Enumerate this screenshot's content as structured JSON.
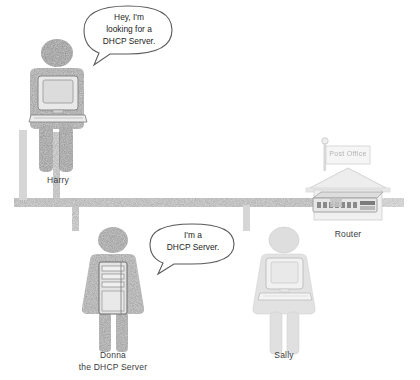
{
  "diagram": {
    "background_color": "#ffffff"
  },
  "network": {
    "bus_label": "network-bus",
    "bus_color": "#c9c9c9",
    "drop_color": "#c9c9c9"
  },
  "actors": [
    {
      "id": "harry",
      "label": "Harry",
      "label2": "",
      "tone": "#8e8e8e",
      "device": "desktop-computer",
      "bubble": {
        "lines": [
          "Hey, I'm",
          "looking for a",
          "DHCP Server."
        ]
      }
    },
    {
      "id": "donna",
      "label": "Donna",
      "label2": "the DHCP Server",
      "tone": "#a3a3a3",
      "device": "server-tower",
      "bubble": {
        "lines": [
          "I'm a",
          "DHCP Server."
        ]
      }
    },
    {
      "id": "sally",
      "label": "Sally",
      "label2": "",
      "tone": "#e2e2e2",
      "device": "desktop-computer",
      "bubble": {
        "lines": []
      }
    }
  ],
  "router": {
    "label": "Router",
    "flag_label": "Post Office",
    "device": "network-switch",
    "port_count": 7,
    "tone": "#ededed"
  }
}
